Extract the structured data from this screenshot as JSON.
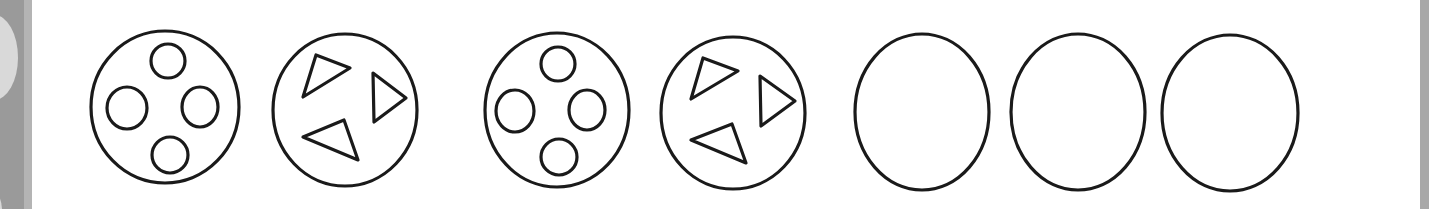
{
  "figure": {
    "type": "pattern-sequence",
    "stroke_color": "#1a1a1a",
    "background": "#ffffff",
    "items": [
      {
        "index": 1,
        "shape": "circle",
        "contents": "four-small-circles",
        "cx": 165,
        "cy": 107,
        "r": 74
      },
      {
        "index": 2,
        "shape": "circle",
        "contents": "three-triangles",
        "cx": 345,
        "cy": 110,
        "r": 72
      },
      {
        "index": 3,
        "shape": "circle",
        "contents": "four-small-circles",
        "cx": 557,
        "cy": 110,
        "r": 72
      },
      {
        "index": 4,
        "shape": "circle",
        "contents": "three-triangles",
        "cx": 733,
        "cy": 113,
        "r": 72
      },
      {
        "index": 5,
        "shape": "circle",
        "contents": "empty",
        "cx": 922,
        "cy": 112,
        "r": 67
      },
      {
        "index": 6,
        "shape": "circle",
        "contents": "empty",
        "cx": 1078,
        "cy": 112,
        "r": 67
      },
      {
        "index": 7,
        "shape": "circle",
        "contents": "empty",
        "cx": 1230,
        "cy": 113,
        "r": 68
      }
    ]
  }
}
